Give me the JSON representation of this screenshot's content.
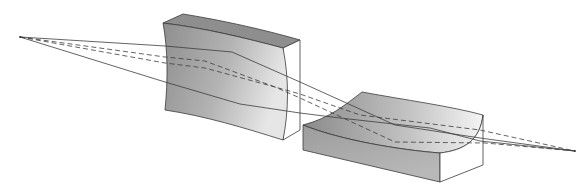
{
  "diagram": {
    "kind": "optics ray diagram",
    "colors": {
      "background": "#ffffff",
      "lens_front": "#9a9a9a",
      "lens_light": "#e8e8e8",
      "lens_top": "#8c8c8c",
      "edge": "#3a3a3a",
      "ray": "#3c3c3c"
    },
    "elements": [
      {
        "id": "source-point",
        "label": "object point (left)",
        "x": 20,
        "y": 37
      },
      {
        "id": "lens-1",
        "label": "vertical cylindrical lens (concave faces)"
      },
      {
        "id": "lens-2",
        "label": "horizontal cylindrical lens (concave top)"
      },
      {
        "id": "image-point",
        "label": "image point (right)",
        "x": 575,
        "y": 151
      }
    ],
    "rays": [
      {
        "style": "solid",
        "name": "marginal ray upper"
      },
      {
        "style": "solid",
        "name": "marginal ray lower"
      },
      {
        "style": "dashed",
        "name": "sagittal ray upper"
      },
      {
        "style": "dashed",
        "name": "sagittal ray lower"
      }
    ]
  }
}
